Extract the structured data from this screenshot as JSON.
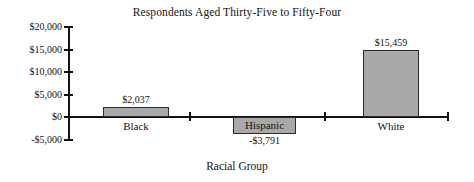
{
  "chart_data": {
    "type": "bar",
    "title": "Respondents Aged Thirty-Five to Fifty-Four",
    "xlabel": "Racial Group",
    "ylabel": "",
    "categories": [
      "Black",
      "Hispanic",
      "White"
    ],
    "values": [
      2037,
      -3791,
      15459
    ],
    "value_labels": [
      "$2,037",
      "-$3,791",
      "$15,459"
    ],
    "ylim": [
      -5000,
      20000
    ],
    "yticks": [
      20000,
      15000,
      10000,
      5000,
      0,
      -5000
    ],
    "ytick_labels": [
      "$20,000",
      "$15,000",
      "$10,000",
      "$5,000",
      "$0",
      "-$5,000"
    ],
    "grid": false,
    "legend": "none",
    "bar_fill_color": "#a9a9a9",
    "bar_edge_color": "#2b2b2b",
    "axis_color": "#111111"
  },
  "axis": {
    "y_labels": [
      {
        "text": "$20,000",
        "top": 22
      },
      {
        "text": "$15,000",
        "top": 45
      },
      {
        "text": "$10,000",
        "top": 67
      },
      {
        "text": "$5,000",
        "top": 90
      },
      {
        "text": "$0",
        "top": 112
      },
      {
        "text": "-$5,000",
        "top": 135
      }
    ],
    "y_ticks_top": [
      26,
      49,
      71,
      94,
      116,
      139
    ],
    "x_ticks_left": [
      189,
      324,
      447
    ]
  },
  "bars": [
    {
      "name": "Black",
      "value_label": "$2,037",
      "left": 103,
      "width": 66,
      "top": 107,
      "height": 10,
      "value_left": 103,
      "value_top": 94,
      "label_left": 103,
      "label_top": 120,
      "label_overlay": false
    },
    {
      "name": "Hispanic",
      "value_label": "-$3,791",
      "left": 233,
      "width": 63,
      "top": 117,
      "height": 17,
      "value_left": 233,
      "value_top": 135,
      "label_left": 233,
      "label_top": 117,
      "label_overlay": true
    },
    {
      "name": "White",
      "value_label": "$15,459",
      "left": 363,
      "width": 56,
      "top": 50,
      "height": 67,
      "value_left": 358,
      "value_top": 37,
      "label_left": 363,
      "label_top": 120,
      "label_overlay": false
    }
  ]
}
